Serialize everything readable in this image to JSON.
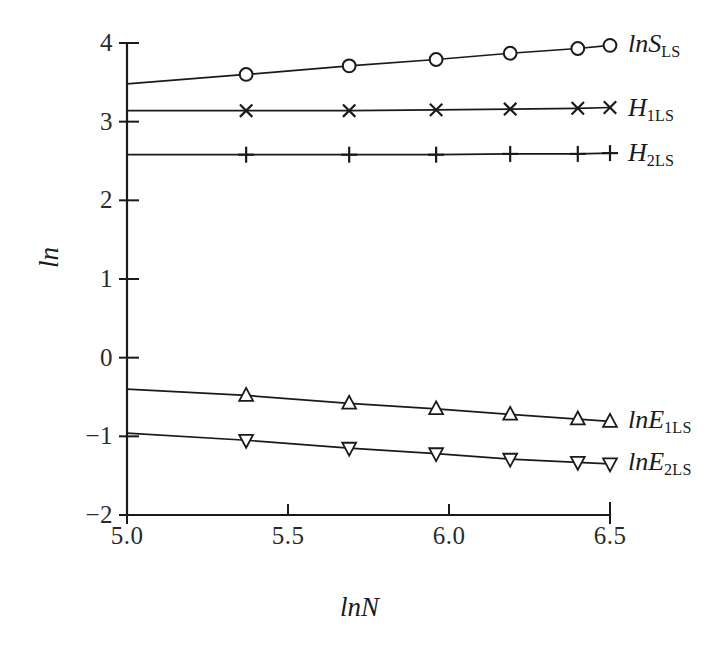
{
  "chart_data": {
    "type": "line",
    "title": "",
    "xlabel": "lnN",
    "ylabel": "ln",
    "xlim": [
      5.0,
      6.5
    ],
    "ylim": [
      -2,
      4
    ],
    "grid": false,
    "legend_position": "right-inline-labels",
    "xticks": [
      "5.0",
      "5.5",
      "6.0",
      "6.5"
    ],
    "xtick_values": [
      5.0,
      5.5,
      6.0,
      6.5
    ],
    "yticks": [
      "4",
      "3",
      "2",
      "1",
      "0",
      "−1",
      "−2"
    ],
    "ytick_values": [
      4,
      3,
      2,
      1,
      0,
      -1,
      -2
    ],
    "x": [
      5.37,
      5.69,
      5.96,
      6.19,
      6.4,
      6.5
    ],
    "series": [
      {
        "name": "lnS_LS",
        "label_main": "lnS",
        "label_sub": "LS",
        "marker": "circle",
        "values": [
          3.6,
          3.71,
          3.79,
          3.87,
          3.93,
          3.97
        ],
        "line_start": [
          5.0,
          3.48
        ],
        "line_end": [
          6.5,
          3.97
        ],
        "label_y": 3.98
      },
      {
        "name": "H_1LS",
        "label_main": "H",
        "label_sub": "1LS",
        "marker": "cross",
        "values": [
          3.14,
          3.14,
          3.15,
          3.16,
          3.17,
          3.18
        ],
        "line_start": [
          5.0,
          3.14
        ],
        "line_end": [
          6.5,
          3.18
        ],
        "label_y": 3.16
      },
      {
        "name": "H_2LS",
        "label_main": "H",
        "label_sub": "2LS",
        "marker": "plus",
        "values": [
          2.58,
          2.58,
          2.58,
          2.59,
          2.59,
          2.6
        ],
        "line_start": [
          5.0,
          2.58
        ],
        "line_end": [
          6.5,
          2.6
        ],
        "label_y": 2.59
      },
      {
        "name": "lnE_1LS",
        "label_main": "lnE",
        "label_sub": "1LS",
        "marker": "triangle-up",
        "values": [
          -0.48,
          -0.58,
          -0.65,
          -0.72,
          -0.78,
          -0.81
        ],
        "line_start": [
          5.0,
          -0.4
        ],
        "line_end": [
          6.5,
          -0.81
        ],
        "label_y": -0.8
      },
      {
        "name": "lnE_2LS",
        "label_main": "lnE",
        "label_sub": "2LS",
        "marker": "triangle-down",
        "values": [
          -1.05,
          -1.15,
          -1.22,
          -1.29,
          -1.33,
          -1.35
        ],
        "line_start": [
          5.0,
          -0.96
        ],
        "line_end": [
          6.5,
          -1.35
        ],
        "label_y": -1.34
      }
    ]
  },
  "colors": {
    "ink": "#1a1a1a",
    "background": "#ffffff"
  }
}
